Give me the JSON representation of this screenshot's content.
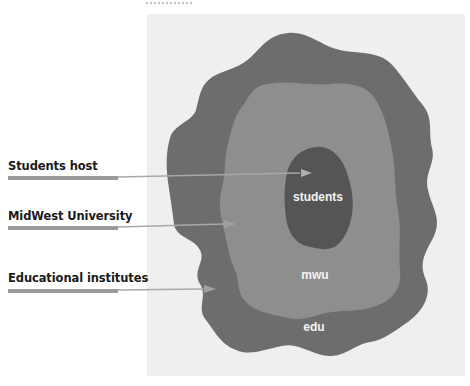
{
  "title_fragment": "",
  "colors": {
    "background": "#ffffff",
    "panel": "#efefef",
    "edu": "#6d6d6d",
    "mwu": "#8e8e8e",
    "students": "#555555",
    "bar": "#9a9a9a",
    "ring_text": "#f4f4f4",
    "label_text": "#1a1a1a"
  },
  "diagram": {
    "rings": [
      {
        "id": "edu",
        "label": "edu"
      },
      {
        "id": "mwu",
        "label": "mwu"
      },
      {
        "id": "students",
        "label": "students"
      }
    ],
    "callouts": [
      {
        "label": "Students host",
        "target": "students"
      },
      {
        "label": "MidWest University",
        "target": "mwu"
      },
      {
        "label": "Educational institutes",
        "target": "edu"
      }
    ]
  }
}
